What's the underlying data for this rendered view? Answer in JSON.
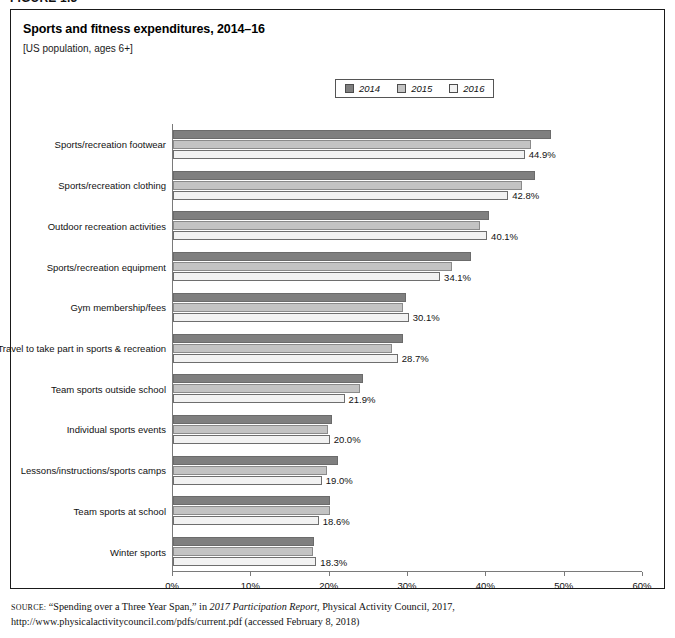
{
  "figure": {
    "number": "FIGURE 1.3",
    "title": "Sports and fitness expenditures, 2014–16",
    "subtitle": "[US population, ages 6+]"
  },
  "legend": {
    "items": [
      {
        "label": "2014",
        "color": "#7f7f7f"
      },
      {
        "label": "2015",
        "color": "#c3c3c3"
      },
      {
        "label": "2016",
        "color": "#f2f2f2"
      }
    ]
  },
  "source": {
    "label": "SOURCE:",
    "text_1": " “Spending over a Three Year Span,” in ",
    "italic_1": "2017 Participation Report",
    "text_2": ", Physical Activity Council, 2017, http://www.physicalactivitycouncil.com/pdfs/current.pdf (accessed February 8, 2018)"
  },
  "chart_data": {
    "type": "bar",
    "orientation": "horizontal",
    "title": "Sports and fitness expenditures, 2014–16",
    "subtitle": "[US population, ages 6+]",
    "xlabel": "",
    "ylabel": "",
    "xlim": [
      0,
      60
    ],
    "xticks": [
      0,
      10,
      20,
      30,
      40,
      50,
      60
    ],
    "xtick_labels": [
      "0%",
      "10%",
      "20%",
      "30%",
      "40%",
      "50%",
      "60%"
    ],
    "grid": false,
    "legend_position": "top-center",
    "value_label_series": "2016",
    "categories": [
      "Sports/recreation footwear",
      "Sports/recreation clothing",
      "Outdoor recreation activities",
      "Sports/recreation equipment",
      "Gym membership/fees",
      "Travel to take part in sports & recreation",
      "Team sports outside school",
      "Individual sports events",
      "Lessons/instructions/sports camps",
      "Team sports at school",
      "Winter sports"
    ],
    "series": [
      {
        "name": "2014",
        "color": "#7f7f7f",
        "values": [
          48.3,
          46.2,
          40.4,
          38.0,
          29.7,
          29.3,
          24.2,
          20.3,
          21.1,
          20.1,
          18.0
        ]
      },
      {
        "name": "2015",
        "color": "#c3c3c3",
        "values": [
          45.7,
          44.5,
          39.2,
          35.6,
          29.4,
          28.0,
          23.9,
          19.8,
          19.6,
          20.0,
          17.9
        ]
      },
      {
        "name": "2016",
        "color": "#f2f2f2",
        "values": [
          44.9,
          42.8,
          40.1,
          34.1,
          30.1,
          28.7,
          21.9,
          20.0,
          19.0,
          18.6,
          18.3
        ]
      }
    ],
    "value_labels": [
      "44.9%",
      "42.8%",
      "40.1%",
      "34.1%",
      "30.1%",
      "28.7%",
      "21.9%",
      "20.0%",
      "19.0%",
      "18.6%",
      "18.3%"
    ]
  }
}
